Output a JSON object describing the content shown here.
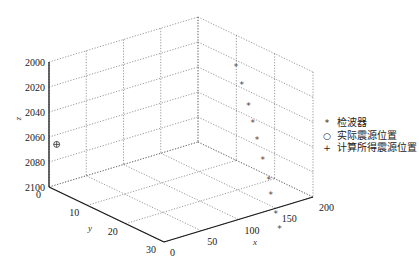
{
  "chart_data": {
    "type": "scatter3d",
    "title": "",
    "xlabel": "x",
    "ylabel": "y",
    "zlabel": "z",
    "xlim": [
      0,
      200
    ],
    "ylim": [
      0,
      30
    ],
    "zlim": [
      2000,
      2100
    ],
    "z_reversed": true,
    "xticks": [
      0,
      50,
      100,
      150,
      200
    ],
    "yticks": [
      0,
      10,
      20,
      30
    ],
    "zticks": [
      2000,
      2020,
      2040,
      2060,
      2080,
      2100
    ],
    "grid": true,
    "legend_position": "right",
    "series": [
      {
        "name": "检波器",
        "marker": "*",
        "points": [
          {
            "x": 150,
            "y": 19.6,
            "z": 2002
          },
          {
            "x": 150,
            "y": 21.1,
            "z": 2014
          },
          {
            "x": 150,
            "y": 22.9,
            "z": 2028
          },
          {
            "x": 150,
            "y": 24.0,
            "z": 2040
          },
          {
            "x": 150,
            "y": 25.1,
            "z": 2052
          },
          {
            "x": 150,
            "y": 26.6,
            "z": 2066
          },
          {
            "x": 150,
            "y": 28.2,
            "z": 2080
          },
          {
            "x": 150,
            "y": 28.7,
            "z": 2091
          },
          {
            "x": 150,
            "y": 30.0,
            "z": 2104
          },
          {
            "x": 150,
            "y": 31.0,
            "z": 2115
          }
        ]
      },
      {
        "name": "实际震源位置",
        "marker": "o",
        "points": [
          {
            "x": 0,
            "y": 2,
            "z": 2063
          }
        ]
      },
      {
        "name": "计算所得震源位置",
        "marker": "+",
        "points": [
          {
            "x": 0,
            "y": 2,
            "z": 2063
          }
        ]
      }
    ]
  },
  "legend": {
    "items": [
      {
        "marker": "*",
        "label": "检波器"
      },
      {
        "marker": "○",
        "label": "实际震源位置"
      },
      {
        "marker": "+",
        "label": "计算所得震源位置"
      }
    ]
  },
  "axes": {
    "xlabel": "x",
    "ylabel": "y",
    "zlabel": "z"
  },
  "colors": {
    "axis": "#1a1a1a",
    "grid": "#555555",
    "marker": "#444444"
  }
}
